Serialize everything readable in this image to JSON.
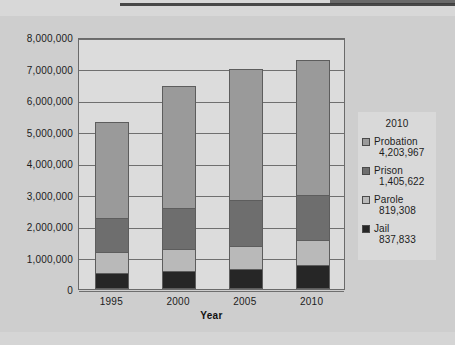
{
  "chart_data": {
    "type": "bar",
    "subtype": "stacked-column",
    "title": "",
    "xlabel": "Year",
    "ylabel": "",
    "categories": [
      "1995",
      "2000",
      "2005",
      "2010"
    ],
    "ylim": [
      0,
      8000000
    ],
    "ytick_labels": [
      "8,000,000",
      "7,000,000",
      "6,000,000",
      "5,000,000",
      "4,000,000",
      "3,000,000",
      "2,000,000",
      "1,000,000",
      "0"
    ],
    "ytick_values": [
      8000000,
      7000000,
      6000000,
      5000000,
      4000000,
      3000000,
      2000000,
      1000000,
      0
    ],
    "grid": true,
    "legend_position": "right",
    "stack_order_bottom_to_top": [
      "Jail",
      "Parole",
      "Prison",
      "Probation"
    ],
    "series": [
      {
        "name": "Jail",
        "color": "#262626",
        "values": [
          500000,
          565000,
          620000,
          748000
        ]
      },
      {
        "name": "Parole",
        "color": "#b9b9b9",
        "values": [
          680000,
          700000,
          745000,
          800000
        ]
      },
      {
        "name": "Prison",
        "color": "#6e6e6e",
        "values": [
          1090000,
          1320000,
          1450000,
          1450000
        ]
      },
      {
        "name": "Probation",
        "color": "#9a9a9a",
        "values": [
          3030000,
          3865000,
          4185000,
          4270000
        ]
      }
    ],
    "totals": [
      5300000,
      6450000,
      7000000,
      7268000
    ]
  },
  "legend": {
    "title": "2010",
    "entries": [
      {
        "label": "Probation",
        "value": "4,203,967",
        "color": "#9a9a9a"
      },
      {
        "label": "Prison",
        "value": "1,405,622",
        "color": "#6e6e6e"
      },
      {
        "label": "Parole",
        "value": "819,308",
        "color": "#b9b9b9"
      },
      {
        "label": "Jail",
        "value": "837,833",
        "color": "#262626"
      }
    ]
  },
  "axis": {
    "x_title": "Year",
    "x_ticks": [
      "1995",
      "2000",
      "2005",
      "2010"
    ],
    "y_ticks": [
      "8,000,000",
      "7,000,000",
      "6,000,000",
      "5,000,000",
      "4,000,000",
      "3,000,000",
      "2,000,000",
      "1,000,000",
      "0"
    ]
  },
  "colors": {
    "page_background": "#cfcfcf",
    "plot_background": "#dcdcdc",
    "axis_line": "#6a6a6a",
    "gridline": "#6f6f6f",
    "text": "#1c1c1c",
    "legend_background": "#d9d9d9"
  }
}
